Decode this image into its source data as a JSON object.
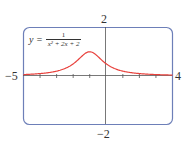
{
  "chart_data": {
    "type": "line",
    "title": "",
    "equation": {
      "lhs": "y =",
      "numerator": "1",
      "denominator": "x² + 2x + 2"
    },
    "function": "1/(x^2+2x+2)",
    "xlim": [
      -5,
      4
    ],
    "ylim": [
      -2,
      2
    ],
    "x_tick_labels": {
      "min": "−5",
      "max": "4"
    },
    "y_tick_labels": {
      "max": "2",
      "min": "−2"
    },
    "x_ticks": [
      -4,
      -3,
      -2,
      -1,
      1,
      2,
      3
    ],
    "grid": false,
    "series": [
      {
        "name": "y = 1/(x^2+2x+2)",
        "color": "#e8413c",
        "x": [
          -5,
          -4,
          -3,
          -2.5,
          -2,
          -1.5,
          -1,
          -0.5,
          0,
          0.5,
          1,
          2,
          3,
          4
        ],
        "y": [
          0.059,
          0.1,
          0.2,
          0.308,
          0.5,
          0.8,
          1.0,
          0.8,
          0.5,
          0.308,
          0.2,
          0.1,
          0.059,
          0.038
        ]
      }
    ],
    "frame_color": "#6d7fb8",
    "axis_color": "#555555"
  }
}
